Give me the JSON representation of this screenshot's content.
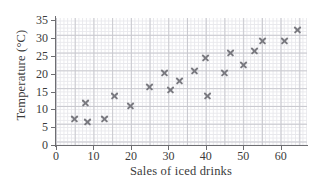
{
  "chart_data": {
    "type": "scatter",
    "title": "",
    "xlabel": "Sales of iced drinks",
    "ylabel": "Temperature (°C)",
    "xlim": [
      0,
      67
    ],
    "ylim": [
      0,
      35.7
    ],
    "xticks": [
      0,
      10,
      20,
      30,
      40,
      50,
      60
    ],
    "yticks": [
      0,
      5,
      10,
      15,
      20,
      25,
      30,
      35
    ],
    "xtick_labels": [
      "0",
      "10",
      "20",
      "30",
      "40",
      "50",
      "60"
    ],
    "ytick_labels": [
      "0",
      "5",
      "10",
      "15",
      "20",
      "25",
      "30",
      "35"
    ],
    "grid": true,
    "grid_major_step_x": 5,
    "grid_major_step_y": 5,
    "grid_minor_step_x": 1,
    "grid_minor_step_y": 1,
    "legend": null,
    "marker": "x",
    "marker_color": "#7a7a80",
    "grid_major_color": "#c9c9cf",
    "grid_minor_color": "#e8e8ec",
    "axis_color": "#6e6e72",
    "points": [
      {
        "x": 5.0,
        "y": 7.5
      },
      {
        "x": 8.0,
        "y": 12.0
      },
      {
        "x": 8.5,
        "y": 6.5
      },
      {
        "x": 13.0,
        "y": 7.5
      },
      {
        "x": 15.5,
        "y": 14.0
      },
      {
        "x": 20.0,
        "y": 11.0
      },
      {
        "x": 25.0,
        "y": 16.5
      },
      {
        "x": 29.0,
        "y": 20.5
      },
      {
        "x": 30.5,
        "y": 15.5
      },
      {
        "x": 33.0,
        "y": 18.0
      },
      {
        "x": 37.0,
        "y": 21.0
      },
      {
        "x": 40.0,
        "y": 24.5
      },
      {
        "x": 40.5,
        "y": 14.0
      },
      {
        "x": 45.0,
        "y": 20.5
      },
      {
        "x": 46.5,
        "y": 26.0
      },
      {
        "x": 50.0,
        "y": 22.5
      },
      {
        "x": 53.0,
        "y": 26.5
      },
      {
        "x": 55.0,
        "y": 29.5
      },
      {
        "x": 61.0,
        "y": 29.5
      },
      {
        "x": 64.5,
        "y": 32.5
      }
    ]
  }
}
